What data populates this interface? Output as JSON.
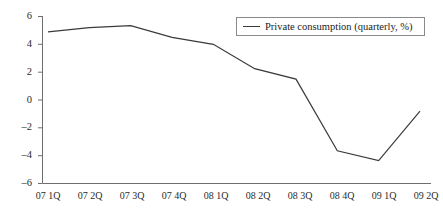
{
  "chart_data": {
    "type": "line",
    "title": "",
    "xlabel": "",
    "ylabel": "",
    "categories": [
      "07 1Q",
      "07 2Q",
      "07 3Q",
      "07 4Q",
      "08 1Q",
      "08 2Q",
      "08 3Q",
      "08 4Q",
      "09 1Q",
      "09 2Q"
    ],
    "series": [
      {
        "name": "Private consumption (quarterly, %)",
        "values": [
          4.9,
          5.2,
          5.35,
          4.5,
          4.0,
          2.25,
          1.5,
          -3.65,
          -4.35,
          -0.8
        ],
        "color": "#3a3a3a"
      }
    ],
    "ylim": [
      -6,
      6
    ],
    "yticks": [
      6,
      4,
      2,
      0,
      -2,
      -4,
      -6
    ],
    "ytick_labels": [
      "6",
      "4",
      "2",
      "0",
      "–2",
      "–4",
      "–6"
    ],
    "grid": false,
    "legend_position": "top-right"
  },
  "legend": {
    "entries": [
      {
        "label": "Private consumption (quarterly, %)",
        "color": "#3a3a3a"
      }
    ]
  },
  "axes": {
    "axis_color": "#6e6e6e",
    "tick_color": "#6e6e6e"
  }
}
